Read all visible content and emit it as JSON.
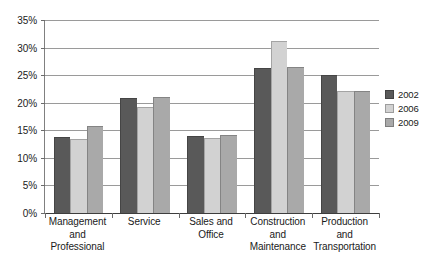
{
  "chart_data": {
    "type": "bar",
    "title": "",
    "xlabel": "",
    "ylabel": "",
    "ylim": [
      0,
      35
    ],
    "ytick_labels": [
      "0%",
      "5%",
      "10%",
      "15%",
      "20%",
      "25%",
      "30%",
      "35%"
    ],
    "ytick_values": [
      0,
      5,
      10,
      15,
      20,
      25,
      30,
      35
    ],
    "grid": true,
    "legend_position": "right",
    "categories": [
      "Management and Professional",
      "Service",
      "Sales and Office",
      "Construction and Maintenance",
      "Production and Transportation"
    ],
    "category_label_lines": [
      [
        "Management",
        "and",
        "Professional"
      ],
      [
        "Service"
      ],
      [
        "Sales and",
        "Office"
      ],
      [
        "Construction",
        "and",
        "Maintenance"
      ],
      [
        "Production",
        "and",
        "Transportation"
      ]
    ],
    "series": [
      {
        "name": "2002",
        "color": "#595959",
        "values": [
          13.7,
          20.8,
          13.9,
          26.3,
          25.1
        ]
      },
      {
        "name": "2006",
        "color": "#d2d2d2",
        "values": [
          13.4,
          19.3,
          13.6,
          31.2,
          22.1
        ]
      },
      {
        "name": "2009",
        "color": "#a9a9a9",
        "values": [
          15.8,
          21.0,
          14.1,
          26.4,
          22.1
        ]
      }
    ]
  }
}
